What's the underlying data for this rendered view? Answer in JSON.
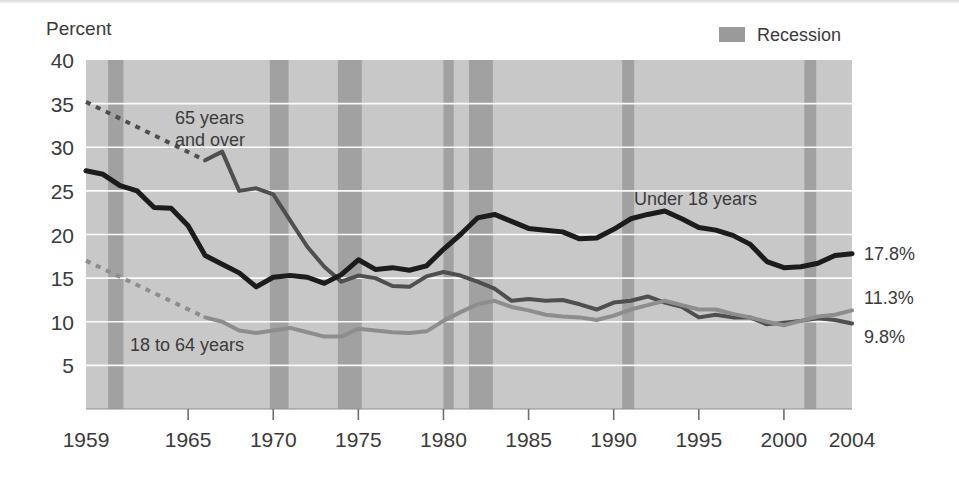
{
  "chart_data": {
    "type": "line",
    "title": "",
    "ylabel": "Percent",
    "xlabel": "",
    "xlim": [
      1959,
      2004
    ],
    "ylim": [
      0,
      40
    ],
    "yticks": [
      5,
      10,
      15,
      20,
      25,
      30,
      35,
      40
    ],
    "xticks": [
      1959,
      1965,
      1970,
      1975,
      1980,
      1985,
      1990,
      1995,
      2000,
      2004
    ],
    "grid": "horizontal",
    "legend": [
      {
        "label": "Recession",
        "color": "#9a9a9a",
        "kind": "band"
      }
    ],
    "plot_background": "#c8c8c8",
    "recession_color": "#9a9a9a",
    "recessions": [
      {
        "start": 1960.3,
        "end": 1961.2
      },
      {
        "start": 1969.8,
        "end": 1970.9
      },
      {
        "start": 1973.8,
        "end": 1975.2
      },
      {
        "start": 1980.0,
        "end": 1980.6
      },
      {
        "start": 1981.5,
        "end": 1982.9
      },
      {
        "start": 1990.5,
        "end": 1991.2
      },
      {
        "start": 2001.2,
        "end": 2001.9
      }
    ],
    "series": [
      {
        "name": "65 years and over",
        "color": "#4f4f4f",
        "width": 4,
        "label_text": "65 years\nand over",
        "label_lines": [
          "65 years",
          "and over"
        ],
        "end_value_label": "9.8%",
        "dashed_from": 1959,
        "dashed_to": 1966,
        "x": [
          1959,
          1966,
          1967,
          1968,
          1969,
          1970,
          1971,
          1972,
          1973,
          1974,
          1975,
          1976,
          1977,
          1978,
          1979,
          1980,
          1981,
          1982,
          1983,
          1984,
          1985,
          1986,
          1987,
          1988,
          1989,
          1990,
          1991,
          1992,
          1993,
          1994,
          1995,
          1996,
          1997,
          1998,
          1999,
          2000,
          2001,
          2002,
          2003,
          2004
        ],
        "y": [
          35.2,
          28.5,
          29.5,
          25.0,
          25.3,
          24.6,
          21.6,
          18.6,
          16.3,
          14.6,
          15.3,
          15.0,
          14.1,
          14.0,
          15.2,
          15.7,
          15.3,
          14.6,
          13.8,
          12.4,
          12.6,
          12.4,
          12.5,
          12.0,
          11.4,
          12.2,
          12.4,
          12.9,
          12.2,
          11.7,
          10.5,
          10.8,
          10.5,
          10.5,
          9.7,
          9.9,
          10.1,
          10.4,
          10.2,
          9.8
        ]
      },
      {
        "name": "Under 18 years",
        "color": "#1c1c1c",
        "width": 5,
        "label_text": "Under 18 years",
        "label_lines": [
          "Under 18 years"
        ],
        "end_value_label": "17.8%",
        "x": [
          1959,
          1960,
          1961,
          1962,
          1963,
          1964,
          1965,
          1966,
          1967,
          1968,
          1969,
          1970,
          1971,
          1972,
          1973,
          1974,
          1975,
          1976,
          1977,
          1978,
          1979,
          1980,
          1981,
          1982,
          1983,
          1984,
          1985,
          1986,
          1987,
          1988,
          1989,
          1990,
          1991,
          1992,
          1993,
          1994,
          1995,
          1996,
          1997,
          1998,
          1999,
          2000,
          2001,
          2002,
          2003,
          2004
        ],
        "y": [
          27.3,
          26.9,
          25.6,
          25.0,
          23.1,
          23.0,
          21.0,
          17.6,
          16.6,
          15.6,
          14.0,
          15.1,
          15.3,
          15.1,
          14.4,
          15.4,
          17.1,
          16.0,
          16.2,
          15.9,
          16.4,
          18.3,
          20.0,
          21.9,
          22.3,
          21.5,
          20.7,
          20.5,
          20.3,
          19.5,
          19.6,
          20.6,
          21.8,
          22.3,
          22.7,
          21.8,
          20.8,
          20.5,
          19.9,
          18.9,
          16.9,
          16.2,
          16.3,
          16.7,
          17.6,
          17.8
        ]
      },
      {
        "name": "18 to 64 years",
        "color": "#8d8d8d",
        "width": 4,
        "label_text": "18 to 64 years",
        "label_lines": [
          "18 to 64 years"
        ],
        "end_value_label": "11.3%",
        "dashed_from": 1959,
        "dashed_to": 1966,
        "x": [
          1959,
          1966,
          1967,
          1968,
          1969,
          1970,
          1971,
          1972,
          1973,
          1974,
          1975,
          1976,
          1977,
          1978,
          1979,
          1980,
          1981,
          1982,
          1983,
          1984,
          1985,
          1986,
          1987,
          1988,
          1989,
          1990,
          1991,
          1992,
          1993,
          1994,
          1995,
          1996,
          1997,
          1998,
          1999,
          2000,
          2001,
          2002,
          2003,
          2004
        ],
        "y": [
          17.0,
          10.5,
          10.0,
          9.0,
          8.7,
          9.0,
          9.3,
          8.8,
          8.3,
          8.3,
          9.2,
          9.0,
          8.8,
          8.7,
          8.9,
          10.1,
          11.1,
          12.0,
          12.4,
          11.7,
          11.3,
          10.8,
          10.6,
          10.5,
          10.2,
          10.7,
          11.4,
          11.9,
          12.4,
          11.9,
          11.4,
          11.4,
          10.9,
          10.5,
          10.0,
          9.6,
          10.1,
          10.6,
          10.8,
          11.3
        ]
      }
    ]
  }
}
